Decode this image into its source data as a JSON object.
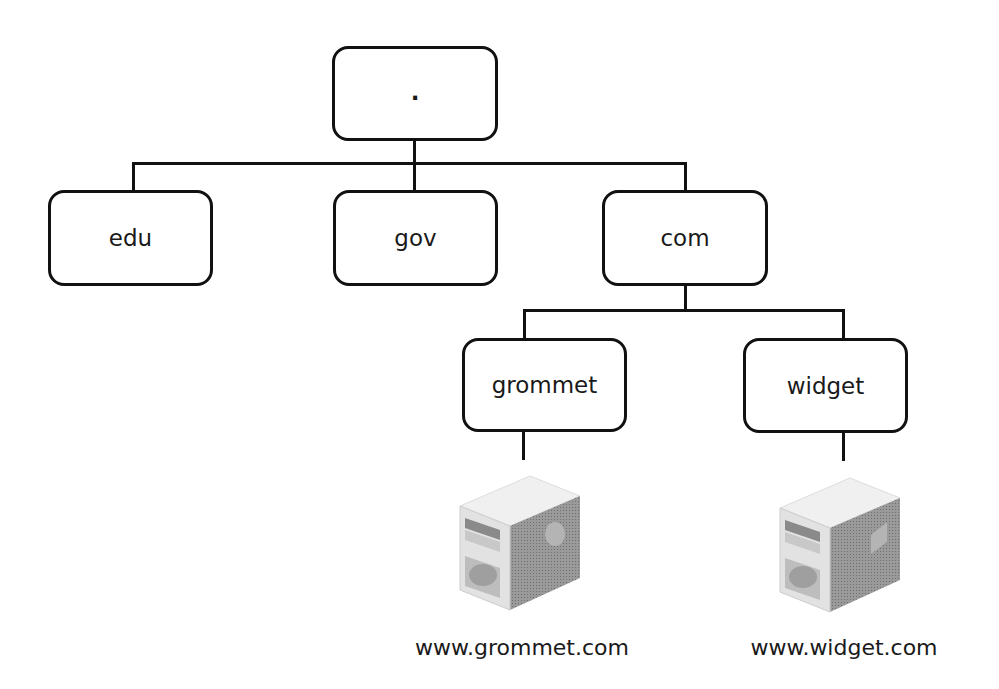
{
  "diagram": {
    "type": "tree",
    "nodes": {
      "root": {
        "label": "."
      },
      "edu": {
        "label": "edu"
      },
      "gov": {
        "label": "gov"
      },
      "com": {
        "label": "com"
      },
      "grommet": {
        "label": "grommet"
      },
      "widget": {
        "label": "widget"
      }
    },
    "servers": {
      "grommet": {
        "icon": "server-icon",
        "label": "www.grommet.com"
      },
      "widget": {
        "icon": "server-icon",
        "label": "www.widget.com"
      }
    },
    "edges": [
      [
        "root",
        "edu"
      ],
      [
        "root",
        "gov"
      ],
      [
        "root",
        "com"
      ],
      [
        "com",
        "grommet"
      ],
      [
        "com",
        "widget"
      ],
      [
        "grommet",
        "www.grommet.com"
      ],
      [
        "widget",
        "www.widget.com"
      ]
    ]
  }
}
